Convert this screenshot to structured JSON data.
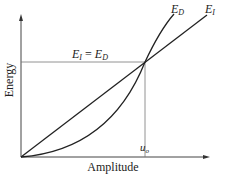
{
  "diagram": {
    "y_axis_label": "Energy",
    "x_axis_label": "Amplitude",
    "curves": [
      {
        "name": "E_D",
        "label_main": "E",
        "label_sub": "D",
        "shape": "convex parabola from origin"
      },
      {
        "name": "E_I",
        "label_main": "E",
        "label_sub": "I",
        "shape": "straight line from origin"
      }
    ],
    "intersection_label": {
      "left_main": "E",
      "left_sub": "I",
      "equals": " = ",
      "right_main": "E",
      "right_sub": "D"
    },
    "x_marker": {
      "main": "u",
      "sub": "o"
    },
    "colors": {
      "line": "#222222",
      "guide": "#666666",
      "background": "#ffffff"
    }
  }
}
